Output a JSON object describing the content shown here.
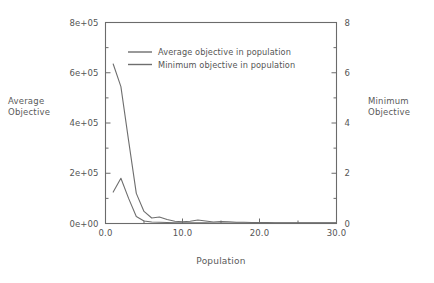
{
  "chart_data": {
    "type": "line",
    "title": "",
    "xlabel": "Population",
    "ylabel": "Average\nObjective",
    "ylabel_right": "Minimum\nObjective",
    "xlim": [
      0.0,
      30.0
    ],
    "ylim": [
      0,
      800000
    ],
    "ylim_right": [
      0,
      8
    ],
    "grid": false,
    "legend_position": "upper-center",
    "xticks": [
      "0.0",
      "10.0",
      "20.0",
      "30.0"
    ],
    "xtick_values": [
      0.0,
      10.0,
      20.0,
      30.0
    ],
    "yticks_left": [
      "0e+00",
      "2e+05",
      "4e+05",
      "6e+05",
      "8e+05"
    ],
    "ytick_values_left": [
      0,
      200000,
      400000,
      600000,
      800000
    ],
    "yticks_right": [
      "0",
      "2",
      "4",
      "6",
      "8"
    ],
    "ytick_values_right": [
      0,
      2,
      4,
      6,
      8
    ],
    "x": [
      1,
      2,
      3,
      4,
      5,
      6,
      7,
      8,
      9,
      10,
      11,
      12,
      13,
      14,
      15,
      16,
      17,
      18,
      19,
      20,
      21,
      22,
      23,
      24,
      25,
      26,
      27,
      28,
      29,
      30
    ],
    "series": [
      {
        "name": "Average objective in population",
        "axis": "left",
        "color": "#6e6e6e",
        "values": [
          635000,
          545000,
          330000,
          120000,
          48000,
          22000,
          26000,
          16000,
          9000,
          7000,
          9000,
          14000,
          10000,
          6000,
          8000,
          7000,
          5000,
          5000,
          4000,
          4000,
          4000,
          3000,
          3000,
          3000,
          3000,
          3000,
          3000,
          3000,
          3000,
          3000
        ]
      },
      {
        "name": "Minimum objective in population",
        "axis": "right",
        "color": "#6e6e6e",
        "values": [
          1.25,
          1.8,
          1.0,
          0.28,
          0.1,
          0.06,
          0.05,
          0.04,
          0.03,
          0.03,
          0.03,
          0.03,
          0.03,
          0.02,
          0.02,
          0.02,
          0.02,
          0.02,
          0.02,
          0.02,
          0.02,
          0.02,
          0.02,
          0.02,
          0.02,
          0.02,
          0.02,
          0.02,
          0.02,
          0.02
        ]
      }
    ],
    "legend": [
      "Average objective in population",
      "Minimum objective in population"
    ]
  }
}
